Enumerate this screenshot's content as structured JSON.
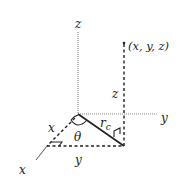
{
  "diagram": {
    "type": "3d-coordinate-cylindrical",
    "colors": {
      "background": "#ffffff",
      "axis": "#8a8a8a",
      "line": "#222222",
      "text": "#222222"
    },
    "axes": {
      "z_label": "z",
      "y_label": "y",
      "x_label": "x"
    },
    "point": {
      "label": "(x, y, z)"
    },
    "segments": {
      "height_label": "z",
      "radius_label": "r",
      "radius_subscript": "c",
      "x_component_label": "x",
      "y_component_label": "y",
      "angle_label": "θ"
    }
  }
}
